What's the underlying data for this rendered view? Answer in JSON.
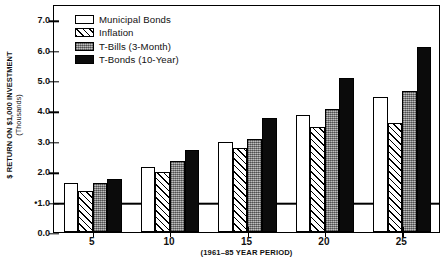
{
  "chart_data": {
    "type": "bar",
    "title": "",
    "subtitle": "",
    "xlabel": "(1961–85 YEAR PERIOD)",
    "ylabel": "$ RETURN ON $1,000 INVESTMENT",
    "ylabel_unit": "(Thousands)",
    "categories": [
      "5",
      "10",
      "15",
      "20",
      "25"
    ],
    "ylim": [
      0.0,
      7.5
    ],
    "yticks": [
      "7.0",
      "6.0",
      "5.0",
      "4.0",
      "3.0",
      "2.0",
      "•1.0",
      "0.0"
    ],
    "ytick_values": [
      7.0,
      6.0,
      5.0,
      4.0,
      3.0,
      2.0,
      1.0,
      0.0
    ],
    "grid": false,
    "legend_position": "top-left",
    "reference_line": {
      "value": 1.0,
      "label": "•1.0"
    },
    "series": [
      {
        "name": "Municipal Bonds",
        "pattern": "open",
        "values": [
          1.6,
          2.15,
          2.95,
          3.85,
          4.45
        ]
      },
      {
        "name": "Inflation",
        "pattern": "hatch",
        "values": [
          1.35,
          1.98,
          2.75,
          3.45,
          3.6
        ]
      },
      {
        "name": "T-Bills (3-Month)",
        "pattern": "stipple",
        "values": [
          1.6,
          2.35,
          3.05,
          4.05,
          4.65
        ]
      },
      {
        "name": "T-Bonds (10-Year)",
        "pattern": "solid",
        "values": [
          1.75,
          2.7,
          3.75,
          5.05,
          6.1
        ]
      }
    ]
  },
  "legend": {
    "items": [
      {
        "label": "Municipal Bonds",
        "swatch": "swatch-open"
      },
      {
        "label": "Inflation",
        "swatch": "swatch-hatch"
      },
      {
        "label": "T-Bills (3-Month)",
        "swatch": "swatch-stipple"
      },
      {
        "label": "T-Bonds (10-Year)",
        "swatch": "swatch-solid"
      }
    ]
  },
  "colors": {
    "axis": "#000000",
    "open": "#ffffff",
    "hatch": "#ffffff",
    "stipple": "#9a9a9a",
    "solid": "#0b0b0b",
    "background": "#ffffff"
  }
}
